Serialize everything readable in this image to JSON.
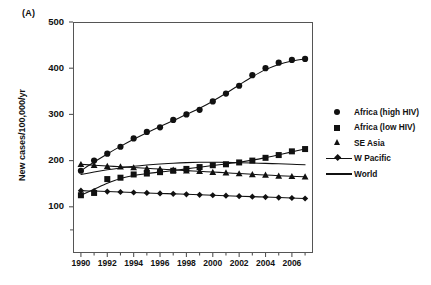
{
  "panel": {
    "label": "(A)"
  },
  "axes": {
    "ylabel": "New cases/100,000/yr",
    "xlabel": "",
    "ytick_labels": [
      "500",
      "400",
      "300",
      "200",
      "100"
    ],
    "xtick_labels": [
      "1990",
      "1992",
      "1994",
      "1996",
      "1998",
      "2000",
      "2002",
      "2004",
      "2006"
    ]
  },
  "legend": {
    "position": "right",
    "items": [
      {
        "label": "Africa (high HIV)",
        "marker": "circle",
        "has_line": false
      },
      {
        "label": "Africa (low HIV)",
        "marker": "square",
        "has_line": false
      },
      {
        "label": "SE Asia",
        "marker": "triangle",
        "has_line": false
      },
      {
        "label": "W Pacific",
        "marker": "diamond",
        "has_line": true
      },
      {
        "label": "World",
        "marker": "none",
        "has_line": true
      }
    ]
  },
  "colors": {
    "ink": "#111111",
    "axis": "#555555",
    "background": "#ffffff"
  },
  "chart_data": {
    "type": "line",
    "title": "",
    "xlabel": "",
    "ylabel": "New cases/100,000/yr",
    "xlim": [
      1989.4,
      2007.6
    ],
    "ylim": [
      0,
      500
    ],
    "yticks": [
      100,
      200,
      300,
      400,
      500
    ],
    "xticks": [
      1990,
      1992,
      1994,
      1996,
      1998,
      2000,
      2002,
      2004,
      2006
    ],
    "grid": false,
    "legend_position": "right",
    "x": [
      1990,
      1991,
      1992,
      1993,
      1994,
      1995,
      1996,
      1997,
      1998,
      1999,
      2000,
      2001,
      2002,
      2003,
      2004,
      2005,
      2006,
      2007
    ],
    "series": [
      {
        "name": "Africa (high HIV)",
        "marker": "circle",
        "line": "fit",
        "values": [
          178,
          200,
          215,
          230,
          248,
          262,
          272,
          288,
          300,
          310,
          328,
          345,
          362,
          385,
          400,
          412,
          418,
          420
        ]
      },
      {
        "name": "Africa (low HIV)",
        "marker": "square",
        "line": "fit",
        "values": [
          125,
          130,
          160,
          163,
          170,
          172,
          175,
          178,
          182,
          186,
          190,
          192,
          196,
          200,
          206,
          212,
          220,
          225
        ]
      },
      {
        "name": "SE Asia",
        "marker": "triangle",
        "line": "fit",
        "values": [
          192,
          190,
          188,
          187,
          185,
          183,
          182,
          180,
          178,
          177,
          175,
          174,
          172,
          170,
          169,
          167,
          166,
          165
        ]
      },
      {
        "name": "W Pacific",
        "marker": "diamond",
        "line": "solid",
        "values": [
          135,
          134,
          133,
          132,
          131,
          130,
          129,
          128,
          127,
          126,
          125,
          124,
          123,
          122,
          121,
          120,
          119,
          118
        ]
      },
      {
        "name": "World",
        "marker": "none",
        "line": "solid",
        "values": [
          170,
          176,
          181,
          185,
          188,
          191,
          193,
          195,
          196,
          197,
          197,
          196,
          196,
          195,
          194,
          193,
          192,
          191
        ]
      }
    ]
  }
}
